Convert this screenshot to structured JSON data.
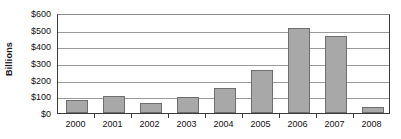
{
  "chart_data": {
    "type": "bar",
    "title": "",
    "xlabel": "",
    "ylabel": "Billions",
    "categories": [
      "2000",
      "2001",
      "2002",
      "2003",
      "2004",
      "2005",
      "2006",
      "2007",
      "2008"
    ],
    "values": [
      80,
      100,
      60,
      95,
      150,
      260,
      510,
      465,
      38
    ],
    "ylim": [
      0,
      600
    ],
    "ytick_values": [
      0,
      100,
      200,
      300,
      400,
      500,
      600
    ],
    "ytick_labels": [
      "$0",
      "$100",
      "$200",
      "$300",
      "$400",
      "$500",
      "$600"
    ],
    "grid": true,
    "legend": false,
    "series_color": "#a8a8a8",
    "series_border_color": "#6e6e6e",
    "gridline_color": "#9a9a9a",
    "axis_color": "#3a3a3a"
  }
}
